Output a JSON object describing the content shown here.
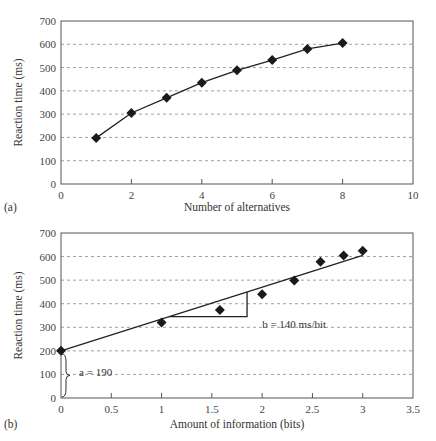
{
  "chart_data": [
    {
      "type": "line",
      "panel_label": "(a)",
      "title": "",
      "xlabel": "Number of alternatives",
      "ylabel": "Reaction time (ms)",
      "xlim": [
        0,
        10
      ],
      "ylim": [
        0,
        700
      ],
      "xticks": [
        0,
        2,
        4,
        6,
        8,
        10
      ],
      "yticks": [
        0,
        100,
        200,
        300,
        400,
        500,
        600,
        700
      ],
      "grid": "horizontal dashed",
      "marker": "diamond",
      "series": [
        {
          "name": "Reaction time",
          "x": [
            1,
            2,
            3,
            4,
            5,
            6,
            7,
            8
          ],
          "y": [
            198,
            305,
            370,
            435,
            488,
            532,
            580,
            605
          ]
        }
      ]
    },
    {
      "type": "scatter",
      "panel_label": "(b)",
      "title": "",
      "xlabel": "Amount of information (bits)",
      "ylabel": "Reaction time (ms)",
      "xlim": [
        0,
        3.5
      ],
      "ylim": [
        0,
        700
      ],
      "xticks": [
        0,
        0.5,
        1,
        1.5,
        2,
        2.5,
        3,
        3.5
      ],
      "yticks": [
        0,
        100,
        200,
        300,
        400,
        500,
        600,
        700
      ],
      "grid": "horizontal dashed",
      "marker": "diamond",
      "series": [
        {
          "name": "Reaction time",
          "x": [
            0,
            1,
            1.58,
            2,
            2.32,
            2.58,
            2.81,
            3
          ],
          "y": [
            200,
            320,
            373,
            440,
            498,
            578,
            605,
            625
          ]
        }
      ],
      "fit_line": {
        "x": [
          0,
          3
        ],
        "y": [
          200,
          605
        ]
      },
      "slope_triangle": {
        "x0": 1.05,
        "x1": 1.85,
        "y_base": 345
      },
      "annotations": [
        {
          "text": "a = 190",
          "x": 0.18,
          "y": 110
        },
        {
          "text": "b = 140 ms/bit",
          "x": 2.0,
          "y": 315
        }
      ]
    }
  ]
}
